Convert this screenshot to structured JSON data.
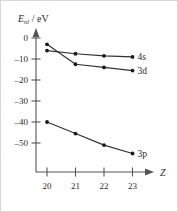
{
  "chart_data": {
    "type": "line",
    "title": "",
    "subtitle": "",
    "xlabel": "Z",
    "ylabel": "E_nl / eV",
    "ylabel_main": "E",
    "ylabel_sub": "nl",
    "ylabel_unit": "/ eV",
    "x": [
      20,
      21,
      22,
      23
    ],
    "xticklabels": [
      "20",
      "21",
      "22",
      "23"
    ],
    "yticks": [
      0,
      -10,
      -20,
      -30,
      -40,
      -50
    ],
    "yticklabels": [
      "0",
      "–10",
      "–20",
      "–30",
      "–40",
      "–50"
    ],
    "xlim": [
      19.6,
      23.7
    ],
    "ylim": [
      -56,
      2
    ],
    "grid": false,
    "legend_position": "inline-right",
    "series": [
      {
        "name": "4s",
        "label": "4s",
        "color": "#333333",
        "values": [
          -6.0,
          -7.5,
          -8.5,
          -9.0
        ]
      },
      {
        "name": "3d",
        "label": "3d",
        "color": "#333333",
        "values": [
          -3.0,
          -12.5,
          -14.0,
          -15.5
        ]
      },
      {
        "name": "3p",
        "label": "3p",
        "color": "#333333",
        "values": [
          -40.0,
          -45.5,
          -51.0,
          -55.0
        ]
      }
    ],
    "annotations": []
  }
}
